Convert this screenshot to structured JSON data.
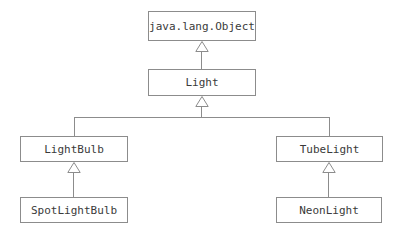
{
  "diagram": {
    "type": "uml-class-diagram",
    "canvas": {
      "width": 399,
      "height": 238,
      "background": "#ffffff"
    },
    "style": {
      "box_border_color": "#8c8c8c",
      "box_fill_color": "#ffffff",
      "line_color": "#8c8c8c",
      "text_color": "#3a3a3a",
      "arrow_type": "generalization-hollow-triangle"
    },
    "classes": [
      {
        "id": "object",
        "label": "java.lang.Object",
        "x": 148,
        "y": 11,
        "w": 108,
        "h": 30
      },
      {
        "id": "light",
        "label": "Light",
        "x": 148,
        "y": 69,
        "w": 108,
        "h": 27
      },
      {
        "id": "lightbulb",
        "label": "LightBulb",
        "x": 20,
        "y": 136,
        "w": 108,
        "h": 26
      },
      {
        "id": "spotlightbulb",
        "label": "SpotLightBulb",
        "x": 20,
        "y": 197,
        "w": 108,
        "h": 26
      },
      {
        "id": "tubelight",
        "label": "TubeLight",
        "x": 276,
        "y": 136,
        "w": 107,
        "h": 26
      },
      {
        "id": "neonlight",
        "label": "NeonLight",
        "x": 276,
        "y": 197,
        "w": 106,
        "h": 26
      }
    ],
    "relationships": [
      {
        "from": "light",
        "to": "object",
        "kind": "extends"
      },
      {
        "from": "lightbulb",
        "to": "light",
        "kind": "extends"
      },
      {
        "from": "tubelight",
        "to": "light",
        "kind": "extends"
      },
      {
        "from": "spotlightbulb",
        "to": "lightbulb",
        "kind": "extends"
      },
      {
        "from": "neonlight",
        "to": "tubelight",
        "kind": "extends"
      }
    ]
  }
}
